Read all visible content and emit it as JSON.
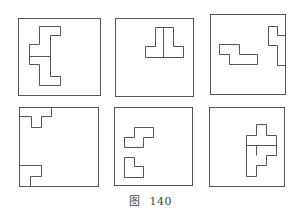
{
  "figure": {
    "caption_prefix": "图",
    "caption_number": "140",
    "stroke_color": "#555555",
    "panels": [
      {
        "name": "panel-1",
        "box": [
          18,
          18,
          82,
          77
        ],
        "paths": [
          "M39 26 H60 V35 H50 V76 H60 V85 H39 V64 H29 V44 H39 Z",
          "M29 56 H50"
        ]
      },
      {
        "name": "panel-2",
        "box": [
          115,
          18,
          78,
          78
        ],
        "paths": [
          "M155 27 H173 V46 H183 V57 H145 V46 H155 Z",
          "M163 27 V57"
        ]
      },
      {
        "name": "panel-3",
        "box": [
          210,
          14,
          75,
          80
        ],
        "paths": [
          "M219 44 H239 V54 H257 V64 H229 V54 H219 Z",
          "M285 35 H277 V26 H268 V45 H277 V65 H285"
        ]
      },
      {
        "name": "panel-4",
        "box": [
          19,
          107,
          79,
          79
        ],
        "paths": [
          "M51 107 V116 H41 V127 H31 V116 H19",
          "M19 165 H41 V176 H30 V186"
        ]
      },
      {
        "name": "panel-5",
        "box": [
          114,
          107,
          78,
          78
        ],
        "paths": [
          "M134 127 H153 V137 H143 V147 H124 V137 H134 Z",
          "M124 157 H134 V166 H143 V177 H124 Z"
        ]
      },
      {
        "name": "panel-6",
        "box": [
          209,
          107,
          75,
          79
        ],
        "paths": [
          "M256 124 H266 V135 H276 V155 H266 V165 H256 V176 H246 V135 H256 Z",
          "M246 145 H276",
          "M256 145 V155"
        ]
      }
    ]
  }
}
